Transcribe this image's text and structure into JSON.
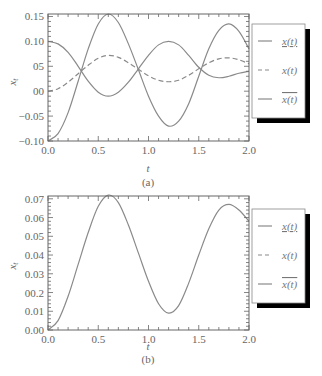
{
  "chart_data": [
    {
      "type": "line",
      "panel": "(a)",
      "title": "",
      "xlabel": "t",
      "ylabel": "x_t",
      "xlim": [
        0.0,
        2.0
      ],
      "ylim": [
        -0.1,
        0.155
      ],
      "x_ticks": [
        "0.0",
        "0.5",
        "1.0",
        "1.5",
        "2.0"
      ],
      "y_ticks": [
        "0.15",
        "0.10",
        "05",
        "00",
        "−0.05",
        "−0.10"
      ],
      "y_tick_values": [
        0.15,
        0.1,
        0.05,
        0.0,
        -0.05,
        -0.1
      ],
      "grid": false,
      "legend_position": "right",
      "x": [
        0.0,
        0.1,
        0.2,
        0.3,
        0.4,
        0.5,
        0.6,
        0.7,
        0.8,
        0.9,
        1.0,
        1.1,
        1.2,
        1.3,
        1.4,
        1.5,
        1.6,
        1.7,
        1.8,
        1.9,
        2.0
      ],
      "series": [
        {
          "name": "x̲(t)",
          "style": "solid",
          "values": [
            0.1,
            0.095,
            0.078,
            0.05,
            0.02,
            -0.002,
            -0.01,
            -0.002,
            0.018,
            0.045,
            0.072,
            0.093,
            0.1,
            0.093,
            0.072,
            0.048,
            0.032,
            0.027,
            0.03,
            0.036,
            0.04
          ]
        },
        {
          "name": "x(t)",
          "style": "dashed",
          "values": [
            0.0,
            0.005,
            0.018,
            0.035,
            0.052,
            0.066,
            0.072,
            0.068,
            0.057,
            0.044,
            0.031,
            0.022,
            0.019,
            0.022,
            0.032,
            0.045,
            0.057,
            0.065,
            0.067,
            0.063,
            0.055
          ]
        },
        {
          "name": "x̄(t)",
          "style": "solid",
          "values": [
            -0.1,
            -0.085,
            -0.043,
            0.02,
            0.085,
            0.135,
            0.155,
            0.138,
            0.095,
            0.043,
            -0.01,
            -0.05,
            -0.07,
            -0.06,
            -0.025,
            0.03,
            0.085,
            0.122,
            0.135,
            0.12,
            0.085
          ]
        }
      ]
    },
    {
      "type": "line",
      "panel": "(b)",
      "title": "",
      "xlabel": "t",
      "ylabel": "x_t",
      "xlim": [
        0.0,
        2.0
      ],
      "ylim": [
        0.0,
        0.0715
      ],
      "x_ticks": [
        "0.0",
        "0.5",
        "1.0",
        "1.5",
        "2.0"
      ],
      "y_ticks": [
        "0.07",
        "0.06",
        "0.05",
        "0.04",
        "0.03",
        "00.2",
        "0.01",
        "0.00"
      ],
      "y_tick_values": [
        0.07,
        0.06,
        0.05,
        0.04,
        0.03,
        0.02,
        0.01,
        0.0
      ],
      "grid": false,
      "legend_position": "right",
      "x": [
        0.0,
        0.1,
        0.2,
        0.3,
        0.4,
        0.5,
        0.6,
        0.7,
        0.8,
        0.9,
        1.0,
        1.1,
        1.2,
        1.3,
        1.4,
        1.5,
        1.6,
        1.7,
        1.8,
        1.9,
        2.0
      ],
      "series": [
        {
          "name": "x(t)",
          "style": "solid",
          "values": [
            0.0,
            0.005,
            0.018,
            0.035,
            0.052,
            0.066,
            0.072,
            0.068,
            0.056,
            0.041,
            0.026,
            0.014,
            0.009,
            0.013,
            0.025,
            0.04,
            0.054,
            0.064,
            0.067,
            0.064,
            0.058
          ]
        }
      ],
      "legend_entries": [
        "x̲(t)",
        "x(t)",
        "x̄(t)"
      ]
    }
  ],
  "figure": {
    "panel_a": {
      "caption": "(a)",
      "xlabel": "t",
      "ylabel": "x",
      "ylabel_sub": "t",
      "x_ticks": [
        "0.0",
        "0.5",
        "1.0",
        "1.5",
        "2.0"
      ],
      "y_ticks": [
        "0.15",
        "0.10",
        "05",
        "00",
        "−0.05",
        "−0.10"
      ],
      "legend": [
        {
          "label": "x(t)",
          "mark": "underline",
          "style": "solid"
        },
        {
          "label": "x(t)",
          "mark": "none",
          "style": "dashed"
        },
        {
          "label": "x(t)",
          "mark": "overline",
          "style": "solid"
        }
      ]
    },
    "panel_b": {
      "caption": "(b)",
      "xlabel": "t",
      "ylabel": "x",
      "ylabel_sub": "t",
      "x_ticks": [
        "0.0",
        "0.5",
        "1.0",
        "1.5",
        "2.0"
      ],
      "y_ticks": [
        "0.07",
        "0.06",
        "0.05",
        "0.04",
        "0.03",
        "00.2",
        "0.01",
        "0.00"
      ],
      "legend": [
        {
          "label": "x(t)",
          "mark": "underline",
          "style": "solid"
        },
        {
          "label": "x(t)",
          "mark": "none",
          "style": "dashed"
        },
        {
          "label": "x(t)",
          "mark": "overline",
          "style": "solid"
        }
      ]
    },
    "colors": {
      "line": "#8a8a8a",
      "axis": "#555555",
      "shadow": "#000000"
    }
  }
}
